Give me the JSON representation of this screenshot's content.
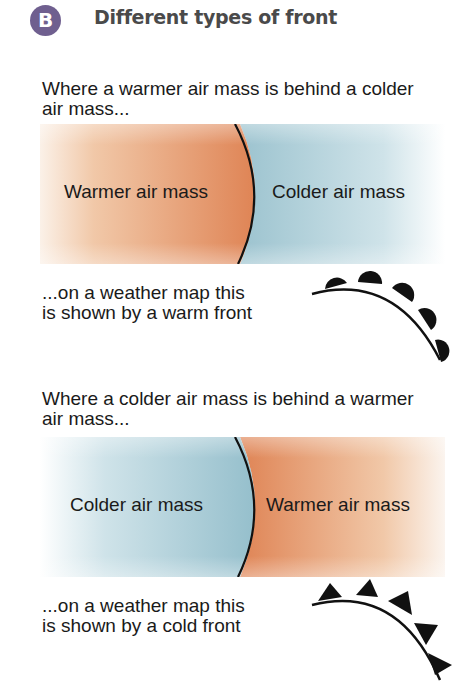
{
  "header": {
    "badge": "B",
    "title": "Different types of front"
  },
  "colors": {
    "badge": "#6f5f8f",
    "warm": "#e08a5e",
    "cold": "#9cc3cf",
    "front_line": "#111111"
  },
  "sections": [
    {
      "intro_line1": "Where a warmer air mass is behind a colder",
      "intro_line2": "air mass...",
      "left_label": "Warmer air mass",
      "right_label": "Colder air mass",
      "caption_line1": "...on a weather map this",
      "caption_line2": "is shown by a warm front",
      "symbol": "warm-front-symbol"
    },
    {
      "intro_line1": "Where a colder air mass is behind a warmer",
      "intro_line2": "air mass...",
      "left_label": "Colder air mass",
      "right_label": "Warmer air mass",
      "caption_line1": "...on a weather map this",
      "caption_line2": "is shown by a cold front",
      "symbol": "cold-front-symbol"
    }
  ]
}
